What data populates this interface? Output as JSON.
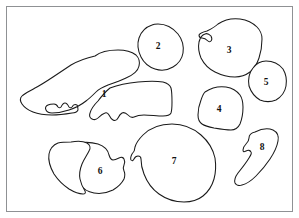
{
  "figure": {
    "type": "specimen-plate",
    "background_color": "#ffffff",
    "frame_color": "#8f9194",
    "outline_color": "#1a1a1a",
    "label_color": "#111111",
    "canvas": {
      "width": 299,
      "height": 218
    }
  },
  "pieces": [
    {
      "id": "piece-1",
      "label": "1",
      "label_x": 104,
      "label_y": 95,
      "path": "M 95 56 C 100 52 110 50 118 50 C 126 50 132 52 136 55 C 139 58 140 62 139 66 C 138 71 133 75 126 78 C 120 81 114 83 108 85 C 103 87 99 89 96 92 C 93 95 90 98 86 101 C 81 105 75 108 69 110 C 63 112 57 113 52 113 C 49 113 47 112 46 110 C 45 108 46 106 48 105 C 50 104 52 104 54 104 C 56 104 57 105 58 107 C 59 108 60 108 61 107 C 62 105 63 103 65 103 C 67 103 68 105 69 107 C 70 108 71 108 72 107 C 73 105 75 104 77 105 C 78 106 78 108 78 110 C 77 112 75 113 72 113 C 66 114 59 115 52 115 C 45 115 38 114 33 112 C 28 110 24 107 22 104 C 20 101 20 98 22 96 C 25 93 30 91 35 88 C 41 85 47 81 53 77 C 59 73 65 69 71 65 C 78 61 86 58 95 56 Z"
    },
    {
      "id": "piece-1b",
      "label": "",
      "label_x": 0,
      "label_y": 0,
      "path": "M 110 88 C 118 85 128 83 138 82 C 148 81 157 81 163 82 C 167 83 170 85 171 88 C 172 92 172 97 172 102 C 172 106 172 110 171 113 C 170 115 167 116 163 116 C 157 116 150 115 144 115 C 139 115 136 116 134 117 C 132 118 130 117 128 115 C 126 113 124 112 122 113 C 120 114 119 116 118 118 C 117 120 115 121 113 120 C 111 119 110 117 109 115 C 108 113 107 112 105 113 C 102 114 100 116 98 118 C 96 120 94 120 92 119 C 90 118 89 116 90 113 C 91 109 94 105 98 101 C 101 97 105 92 110 88 Z"
    },
    {
      "id": "piece-2",
      "label": "2",
      "label_x": 158,
      "label_y": 47,
      "path": "M 158 24 C 166 24 173 28 178 34 C 182 39 184 46 183 53 C 182 59 178 64 173 67 C 168 70 161 71 155 69 C 149 67 144 63 141 57 C 138 51 137 44 139 38 C 141 32 146 27 152 25 C 154 24 156 24 158 24 Z"
    },
    {
      "id": "piece-3",
      "label": "3",
      "label_x": 229,
      "label_y": 51,
      "path": "M 218 24 C 224 20 232 18 240 19 C 247 20 253 23 257 27 C 260 30 262 34 262 39 C 262 45 261 52 259 58 C 257 64 254 69 250 72 C 246 75 241 77 235 77 C 228 77 221 75 215 72 C 209 69 204 64 201 58 C 199 53 198 47 199 42 C 200 38 202 35 205 34 C 207 33 209 34 211 36 C 212 38 212 40 211 41 C 210 42 209 42 208 41 C 206 39 204 38 202 38 C 200 38 199 37 199 35 C 200 33 203 32 207 31 C 211 29 215 27 218 24 Z"
    },
    {
      "id": "piece-4",
      "label": "4",
      "label_x": 219,
      "label_y": 110,
      "path": "M 205 92 C 211 88 219 86 226 87 C 232 88 237 91 240 95 C 242 98 243 102 243 107 C 243 113 242 119 240 124 C 238 128 235 130 231 130 C 226 130 220 129 214 128 C 209 127 205 126 202 124 C 199 122 198 119 198 115 C 198 110 199 105 201 100 C 202 97 203 94 205 92 Z"
    },
    {
      "id": "piece-5",
      "label": "5",
      "label_x": 266,
      "label_y": 83,
      "path": "M 266 61 C 273 61 279 64 283 69 C 286 74 287 80 286 86 C 285 92 281 97 276 100 C 271 102 265 102 260 100 C 255 97 251 92 249 86 C 248 80 249 73 253 68 C 256 64 261 61 266 61 Z"
    },
    {
      "id": "piece-6",
      "label": "6",
      "label_x": 100,
      "label_y": 172,
      "path": "M 74 144 C 82 142 91 142 98 144 C 104 146 108 150 109 155 C 110 158 111 160 113 160 C 115 160 117 159 119 158 C 121 157 123 157 124 159 C 125 161 125 163 124 165 C 123 167 123 169 124 171 C 125 173 125 176 124 179 C 122 183 118 187 113 190 C 107 193 100 194 94 193 C 88 192 83 189 80 184 C 78 180 77 176 78 171 C 79 166 81 161 84 157 C 86 154 88 151 88 148 C 88 146 87 145 85 145 C 83 145 81 146 80 148 C 79 150 78 151 77 151 C 76 150 76 148 76 146 C 75 145 74 144 74 144 Z"
    },
    {
      "id": "piece-6b",
      "label": "",
      "label_x": 0,
      "label_y": 0,
      "path": "M 71 142 C 77 141 83 141 87 143 C 90 145 91 148 89 151 C 87 155 84 159 82 164 C 80 169 79 174 80 179 C 81 184 83 188 85 191 C 86 193 85 194 83 194 C 79 194 74 192 69 189 C 63 185 58 180 54 174 C 50 167 48 160 49 154 C 50 149 53 145 58 143 C 62 142 67 142 71 142 Z"
    },
    {
      "id": "piece-7",
      "label": "7",
      "label_x": 174,
      "label_y": 162,
      "path": "M 172 124 C 183 124 193 128 201 135 C 208 141 213 149 215 158 C 216 165 216 172 214 179 C 212 186 208 192 203 196 C 198 200 191 202 184 202 C 175 202 166 199 159 194 C 152 189 147 182 144 174 C 142 169 141 164 141 159 C 141 157 140 156 138 156 C 136 156 135 157 134 159 C 133 161 132 161 131 160 C 130 158 131 156 132 154 C 134 152 135 150 135 147 C 136 143 139 139 143 135 C 150 128 161 124 172 124 Z"
    },
    {
      "id": "piece-8",
      "label": "8",
      "label_x": 262,
      "label_y": 148,
      "path": "M 255 132 C 261 129 268 128 273 130 C 277 132 279 136 278 141 C 277 147 274 153 270 159 C 266 165 261 171 256 176 C 251 181 246 184 242 185 C 239 186 236 185 235 183 C 234 180 235 177 238 173 C 242 168 246 163 249 158 C 251 155 252 153 251 152 C 250 150 248 150 246 151 C 244 152 243 152 243 150 C 243 148 244 146 246 144 C 248 142 249 140 249 138 C 249 135 251 133 255 132 Z"
    }
  ]
}
